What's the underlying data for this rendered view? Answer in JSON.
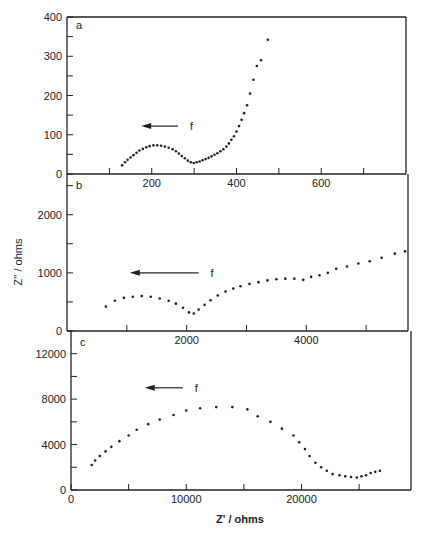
{
  "chart_data": [
    {
      "type": "scatter",
      "panel": "a",
      "title": "",
      "xlabel": "Z' / ohms",
      "ylabel": "Z'' / ohms",
      "xlim": [
        0,
        800
      ],
      "ylim": [
        0,
        400
      ],
      "x_ticks": [
        200,
        400,
        600
      ],
      "x_minor_ticks": [
        100,
        300,
        500,
        700
      ],
      "y_ticks": [
        0,
        100,
        200,
        300,
        400
      ],
      "y_minor_ticks": [
        50,
        150,
        250,
        350
      ],
      "annotation": {
        "text": "f",
        "arrow": "left",
        "x_from": 262,
        "x_to": 175,
        "y": 122
      },
      "grid": false,
      "series": [
        {
          "name": "a",
          "x": [
            130,
            137,
            143,
            150,
            157,
            164,
            171,
            179,
            187,
            195,
            204,
            213,
            222,
            231,
            240,
            249,
            257,
            264,
            271,
            278,
            285,
            292,
            299,
            306,
            313,
            320,
            327,
            334,
            341,
            348,
            355,
            362,
            369,
            376,
            382,
            388,
            394,
            400,
            406,
            412,
            418,
            425,
            432,
            440,
            448,
            458,
            474
          ],
          "y": [
            22,
            30,
            36,
            42,
            48,
            54,
            60,
            64,
            68,
            71,
            73,
            73,
            72,
            70,
            67,
            63,
            58,
            52,
            46,
            40,
            34,
            30,
            28,
            30,
            32,
            35,
            38,
            41,
            45,
            49,
            53,
            58,
            63,
            70,
            78,
            87,
            96,
            108,
            122,
            138,
            155,
            175,
            205,
            240,
            275,
            290,
            342
          ]
        }
      ]
    },
    {
      "type": "scatter",
      "panel": "b",
      "xlim": [
        0,
        5700
      ],
      "ylim": [
        0,
        2700
      ],
      "x_ticks": [
        2000,
        4000
      ],
      "x_minor_ticks": [
        1000,
        3000,
        5000
      ],
      "y_ticks": [
        0,
        1000,
        2000
      ],
      "y_minor_ticks": [
        500,
        1500,
        2500
      ],
      "annotation": {
        "text": "f",
        "arrow": "left",
        "x_from": 2200,
        "x_to": 1050,
        "y": 1000
      },
      "grid": false,
      "series": [
        {
          "name": "b",
          "x": [
            650,
            800,
            950,
            1100,
            1250,
            1400,
            1550,
            1700,
            1820,
            1940,
            2040,
            2120,
            2200,
            2300,
            2400,
            2520,
            2650,
            2780,
            2900,
            3050,
            3200,
            3350,
            3500,
            3650,
            3800,
            3950,
            4080,
            4220,
            4360,
            4500,
            4680,
            4870,
            5060,
            5260,
            5480,
            5650
          ],
          "y": [
            420,
            520,
            570,
            590,
            600,
            590,
            560,
            520,
            470,
            400,
            320,
            300,
            370,
            450,
            530,
            610,
            680,
            730,
            770,
            810,
            840,
            870,
            890,
            900,
            900,
            880,
            930,
            960,
            1000,
            1070,
            1110,
            1160,
            1200,
            1260,
            1330,
            1370
          ]
        }
      ]
    },
    {
      "type": "scatter",
      "panel": "c",
      "xlim": [
        0,
        29500
      ],
      "ylim": [
        0,
        14000
      ],
      "x_ticks": [
        0,
        10000,
        20000
      ],
      "x_minor_ticks": [
        5000,
        15000,
        25000
      ],
      "y_ticks": [
        0,
        4000,
        8000,
        12000
      ],
      "y_minor_ticks": [
        2000,
        6000,
        10000
      ],
      "annotation": {
        "text": "f",
        "arrow": "left",
        "x_from": 9700,
        "x_to": 6400,
        "y": 9000
      },
      "grid": false,
      "series": [
        {
          "name": "c",
          "x": [
            1800,
            2100,
            2500,
            3000,
            3500,
            4200,
            5000,
            5700,
            6700,
            7700,
            8900,
            10000,
            11200,
            12600,
            14000,
            15300,
            16200,
            17300,
            18300,
            19300,
            19800,
            20300,
            20700,
            21200,
            21700,
            22200,
            22700,
            23300,
            23800,
            24300,
            24800,
            25200,
            25600,
            26000,
            26400,
            26800
          ],
          "y": [
            2200,
            2600,
            3000,
            3400,
            3800,
            4300,
            4800,
            5300,
            5800,
            6200,
            6600,
            7000,
            7200,
            7300,
            7300,
            7100,
            6500,
            6000,
            5400,
            4800,
            4200,
            3600,
            3000,
            2400,
            2000,
            1700,
            1400,
            1300,
            1200,
            1150,
            1100,
            1200,
            1300,
            1500,
            1600,
            1700
          ]
        }
      ]
    }
  ],
  "labels": {
    "panel_a": "a",
    "panel_b": "b",
    "panel_c": "c",
    "arrow_label": "f",
    "y_axis_title": "Z'' / ohms",
    "x_axis_title": "Z' / ohms"
  }
}
